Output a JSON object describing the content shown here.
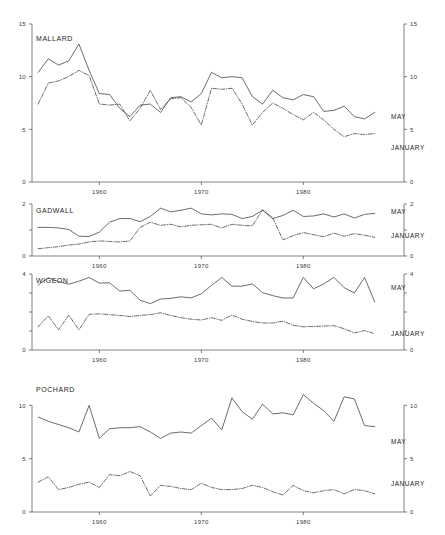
{
  "figure": {
    "title": "",
    "x_tick_labels": [
      "1960",
      "1970",
      "1980"
    ],
    "x_ticks": [
      1960,
      1970,
      1980
    ],
    "xlim": [
      1953.4,
      1988.2
    ],
    "series_names": {
      "may": "MAY",
      "january": "JANUARY"
    }
  },
  "chart_data": [
    {
      "type": "line",
      "title": "MALLARD",
      "xlabel": "",
      "ylabel": "",
      "ylim": [
        0,
        15
      ],
      "yticks": [
        0,
        5,
        10,
        15
      ],
      "ytick_labels": [
        "0",
        "5",
        "10",
        "15"
      ],
      "grid": false,
      "legend": "right-inline",
      "x": [
        1954,
        1955,
        1956,
        1957,
        1958,
        1959,
        1960,
        1961,
        1962,
        1963,
        1964,
        1965,
        1966,
        1967,
        1968,
        1969,
        1970,
        1971,
        1972,
        1973,
        1974,
        1975,
        1976,
        1977,
        1978,
        1979,
        1980,
        1981,
        1982,
        1983,
        1984,
        1985,
        1986,
        1987
      ],
      "series": [
        {
          "name": "MAY",
          "style": "solid",
          "values": [
            10.4,
            11.7,
            11.1,
            11.5,
            13.1,
            10.6,
            8.4,
            8.3,
            7.0,
            6.2,
            7.3,
            7.4,
            6.6,
            8.0,
            8.1,
            7.6,
            8.4,
            10.4,
            9.9,
            10.0,
            9.9,
            8.1,
            7.4,
            8.7,
            8.0,
            7.8,
            8.3,
            8.1,
            6.7,
            6.8,
            7.2,
            6.2,
            6.0,
            6.6
          ]
        },
        {
          "name": "JANUARY",
          "style": "dash-dot",
          "values": [
            7.4,
            9.4,
            9.6,
            10.0,
            10.6,
            10.1,
            7.4,
            7.3,
            7.4,
            5.8,
            7.0,
            8.7,
            6.9,
            7.9,
            8.0,
            7.1,
            5.4,
            8.9,
            8.8,
            8.9,
            7.4,
            5.4,
            6.6,
            7.5,
            7.0,
            6.4,
            5.9,
            6.6,
            5.9,
            5.0,
            4.3,
            4.6,
            4.5,
            4.6
          ]
        }
      ]
    },
    {
      "type": "line",
      "title": "GADWALL",
      "xlabel": "",
      "ylabel": "",
      "ylim": [
        0,
        2
      ],
      "yticks": [
        0,
        1,
        2
      ],
      "ytick_labels": [
        "0",
        "",
        "2"
      ],
      "grid": false,
      "legend": "right-inline",
      "x": [
        1954,
        1955,
        1956,
        1957,
        1958,
        1959,
        1960,
        1961,
        1962,
        1963,
        1964,
        1965,
        1966,
        1967,
        1968,
        1969,
        1970,
        1971,
        1972,
        1973,
        1974,
        1975,
        1976,
        1977,
        1978,
        1979,
        1980,
        1981,
        1982,
        1983,
        1984,
        1985,
        1986,
        1987
      ],
      "series": [
        {
          "name": "MAY",
          "style": "solid",
          "values": [
            1.1,
            1.1,
            1.08,
            1.02,
            0.76,
            0.75,
            0.92,
            1.3,
            1.44,
            1.44,
            1.32,
            1.52,
            1.84,
            1.7,
            1.76,
            1.84,
            1.62,
            1.58,
            1.62,
            1.6,
            1.44,
            1.52,
            1.76,
            1.44,
            1.56,
            1.76,
            1.52,
            1.54,
            1.62,
            1.5,
            1.62,
            1.46,
            1.6,
            1.64
          ]
        },
        {
          "name": "JANUARY",
          "style": "dash-dot",
          "values": [
            0.28,
            0.32,
            0.36,
            0.42,
            0.46,
            0.54,
            0.58,
            0.56,
            0.54,
            0.58,
            1.1,
            1.3,
            1.18,
            1.22,
            1.12,
            1.18,
            1.2,
            1.22,
            1.08,
            1.22,
            1.18,
            1.16,
            1.78,
            1.46,
            0.62,
            0.78,
            0.9,
            0.82,
            0.74,
            0.88,
            0.76,
            0.86,
            0.8,
            0.72
          ]
        }
      ]
    },
    {
      "type": "line",
      "title": "WIGEON",
      "xlabel": "",
      "ylabel": "",
      "ylim": [
        0,
        4
      ],
      "yticks": [
        0,
        1,
        2,
        3,
        4
      ],
      "ytick_labels": [
        "0",
        "",
        "",
        "",
        "4"
      ],
      "grid": false,
      "legend": "right-inline",
      "x": [
        1954,
        1955,
        1956,
        1957,
        1958,
        1959,
        1960,
        1961,
        1962,
        1963,
        1964,
        1965,
        1966,
        1967,
        1968,
        1969,
        1970,
        1971,
        1972,
        1973,
        1974,
        1975,
        1976,
        1977,
        1978,
        1979,
        1980,
        1981,
        1982,
        1983,
        1984,
        1985,
        1986,
        1987
      ],
      "series": [
        {
          "name": "MAY",
          "style": "solid",
          "values": [
            3.42,
            3.8,
            3.6,
            3.46,
            3.62,
            3.82,
            3.52,
            3.54,
            3.1,
            3.14,
            2.62,
            2.44,
            2.68,
            2.72,
            2.8,
            2.74,
            2.96,
            3.4,
            3.82,
            3.36,
            3.36,
            3.48,
            3.02,
            2.86,
            2.74,
            2.74,
            3.82,
            3.22,
            3.48,
            3.82,
            3.28,
            3.0,
            3.82,
            2.52
          ]
        },
        {
          "name": "JANUARY",
          "style": "dash-dot",
          "values": [
            1.22,
            1.8,
            1.06,
            1.84,
            1.06,
            1.88,
            1.9,
            1.86,
            1.82,
            1.76,
            1.82,
            1.86,
            1.96,
            1.82,
            1.7,
            1.62,
            1.58,
            1.7,
            1.56,
            1.84,
            1.62,
            1.5,
            1.42,
            1.42,
            1.52,
            1.3,
            1.22,
            1.24,
            1.26,
            1.28,
            1.12,
            0.9,
            1.02,
            0.86
          ]
        }
      ]
    },
    {
      "type": "line",
      "title": "POCHARD",
      "xlabel": "",
      "ylabel": "",
      "ylim": [
        0,
        12
      ],
      "yticks": [
        0,
        5,
        10
      ],
      "ytick_labels": [
        "0",
        "5",
        "10"
      ],
      "grid": false,
      "legend": "right-inline",
      "x": [
        1954,
        1955,
        1956,
        1957,
        1958,
        1959,
        1960,
        1961,
        1962,
        1963,
        1964,
        1965,
        1966,
        1967,
        1968,
        1969,
        1970,
        1971,
        1972,
        1973,
        1974,
        1975,
        1976,
        1977,
        1978,
        1979,
        1980,
        1981,
        1982,
        1983,
        1984,
        1985,
        1986,
        1987
      ],
      "series": [
        {
          "name": "MAY",
          "style": "solid",
          "values": [
            8.9,
            8.5,
            8.2,
            7.9,
            7.5,
            10.0,
            6.9,
            7.8,
            7.9,
            7.9,
            8.0,
            7.5,
            6.9,
            7.4,
            7.5,
            7.4,
            8.1,
            8.8,
            7.7,
            10.7,
            9.4,
            8.7,
            10.1,
            9.2,
            9.3,
            9.1,
            11.0,
            10.2,
            9.5,
            8.5,
            10.8,
            10.6,
            8.1,
            8.0
          ]
        },
        {
          "name": "JANUARY",
          "style": "dash-dot",
          "values": [
            2.8,
            3.3,
            2.1,
            2.3,
            2.6,
            2.8,
            2.3,
            3.5,
            3.4,
            3.8,
            3.4,
            1.5,
            2.5,
            2.4,
            2.2,
            2.1,
            2.7,
            2.3,
            2.1,
            2.1,
            2.2,
            2.5,
            2.3,
            1.9,
            1.6,
            2.5,
            2.0,
            1.8,
            2.0,
            2.1,
            1.7,
            2.1,
            2.0,
            1.7
          ]
        }
      ]
    }
  ],
  "panels": [
    {
      "key": "mallard",
      "label": "MALLARD"
    },
    {
      "key": "gadwall",
      "label": "GADWALL"
    },
    {
      "key": "wigeon",
      "label": "WIGEON"
    },
    {
      "key": "pochard",
      "label": "POCHARD"
    }
  ]
}
